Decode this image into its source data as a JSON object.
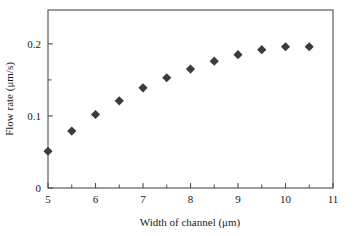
{
  "chart_data": {
    "type": "scatter",
    "title": "",
    "xlabel": "Width of channel (μm)",
    "ylabel": "Flow rate (μm/s)",
    "xlim": [
      5,
      11
    ],
    "ylim": [
      0,
      0.247
    ],
    "grid": false,
    "legend": null,
    "marker_style": "filled-diamond",
    "marker_color": "#3b3b3b",
    "x_ticks": [
      5,
      6,
      7,
      8,
      9,
      10,
      11
    ],
    "x_tick_labels": [
      "5",
      "6",
      "7",
      "8",
      "9",
      "10",
      "11"
    ],
    "x_minor_ticks": [
      5.5,
      6.5,
      7.5,
      8.5,
      9.5,
      10.5
    ],
    "y_ticks": [
      0,
      0.1,
      0.2
    ],
    "y_tick_labels": [
      "0",
      "0.1",
      "0.2"
    ],
    "y_minor_ticks": [
      0.05,
      0.15
    ],
    "x": [
      5,
      5.5,
      6,
      6.5,
      7,
      7.5,
      8,
      8.5,
      9,
      9.5,
      10,
      10.5
    ],
    "values": [
      0.051,
      0.079,
      0.102,
      0.121,
      0.139,
      0.153,
      0.165,
      0.176,
      0.185,
      0.192,
      0.196,
      0.196
    ]
  }
}
